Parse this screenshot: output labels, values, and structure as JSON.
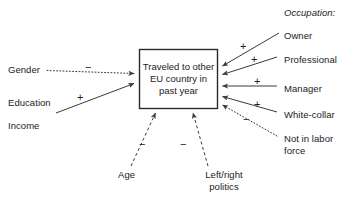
{
  "diagram": {
    "type": "path-model-diagram",
    "outcome_box": {
      "label": "Traveled to other EU country in past year",
      "lines": [
        "Traveled to",
        "other EU",
        "country in past",
        "year"
      ]
    },
    "group_headings": [
      {
        "name": "occupation-heading",
        "label": "Occupation:"
      }
    ],
    "predictors_left": [
      {
        "name": "gender",
        "label": "Gender",
        "sign": "−",
        "line_style": "dotted",
        "has_arrow": true
      },
      {
        "name": "education",
        "label": "Education",
        "sign": "+",
        "line_style": "solid",
        "has_arrow": true
      },
      {
        "name": "income",
        "label": "Income",
        "sign": "",
        "line_style": "none",
        "has_arrow": false
      }
    ],
    "predictors_bottom": [
      {
        "name": "age",
        "label": "Age",
        "sign": "−",
        "line_style": "dashed",
        "has_arrow": true
      },
      {
        "name": "left-right-politics",
        "label": "Left/right politics",
        "lines": [
          "Left/right",
          "politics"
        ],
        "sign": "−",
        "line_style": "dashed",
        "has_arrow": true
      }
    ],
    "predictors_right": [
      {
        "name": "owner",
        "label": "Owner",
        "sign": "+",
        "line_style": "solid",
        "has_arrow": true
      },
      {
        "name": "professional",
        "label": "Professional",
        "sign": "+",
        "line_style": "solid",
        "has_arrow": true
      },
      {
        "name": "manager",
        "label": "Manager",
        "sign": "+",
        "line_style": "solid",
        "has_arrow": true
      },
      {
        "name": "white-collar",
        "label": "White-collar",
        "sign": "+",
        "line_style": "solid",
        "has_arrow": true
      },
      {
        "name": "not-in-labor-force",
        "label": "Not in labor force",
        "lines": [
          "Not in labor",
          "force"
        ],
        "sign": "−",
        "line_style": "dotted",
        "has_arrow": true
      }
    ],
    "colors": {
      "line": "#3a3a3a",
      "box_border": "#2b2b2b",
      "text": "#222222",
      "background": "#ffffff"
    },
    "caption_cropped": ""
  }
}
